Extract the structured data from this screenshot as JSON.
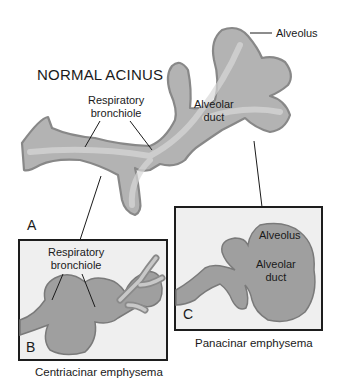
{
  "figure": {
    "title": "NORMAL ACINUS",
    "panel_a": {
      "letter": "A",
      "labels": {
        "alveolus": "Alveolus",
        "respiratory_bronchiole_line1": "Respiratory",
        "respiratory_bronchiole_line2": "bronchiole",
        "alveolar_duct_line1": "Alveolar",
        "alveolar_duct_line2": "duct"
      }
    },
    "panel_b": {
      "letter": "B",
      "labels": {
        "respiratory_bronchiole_line1": "Respiratory",
        "respiratory_bronchiole_line2": "bronchiole"
      },
      "caption": "Centriacinar emphysema"
    },
    "panel_c": {
      "letter": "C",
      "labels": {
        "alveolus": "Alveolus",
        "alveolar_duct_line1": "Alveolar",
        "alveolar_duct_line2": "duct"
      },
      "caption": "Panacinar emphysema"
    },
    "colors": {
      "tissue_fill": "#a9a9a9",
      "tissue_light": "#c9c9c9",
      "tissue_outline": "#7a7a7a",
      "box_bg": "#efefef",
      "box_border": "#1d1d1d",
      "text": "#1a1a1a"
    }
  }
}
